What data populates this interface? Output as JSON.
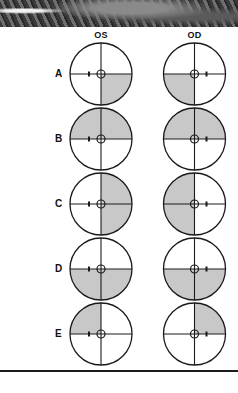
{
  "figure": {
    "photo_strip": "grayscale-fundus-image-fragment",
    "columns": [
      {
        "label": "OS",
        "cx": 101
      },
      {
        "label": "OD",
        "cx": 194.5
      }
    ],
    "radius": 31,
    "fixation_radius": 4,
    "shade_color": "#c8c8c8",
    "line_color": "#1a1a1a",
    "rows": [
      {
        "label": "A",
        "cy": 74,
        "OS": [
          "lower-right"
        ],
        "OD": [
          "lower-left"
        ]
      },
      {
        "label": "B",
        "cy": 139,
        "OS": [
          "upper-left",
          "upper-right"
        ],
        "OD": [
          "upper-left",
          "upper-right"
        ]
      },
      {
        "label": "C",
        "cy": 204,
        "OS": [
          "upper-right",
          "lower-right"
        ],
        "OD": [
          "upper-left",
          "lower-left"
        ]
      },
      {
        "label": "D",
        "cy": 269,
        "OS": [
          "lower-left",
          "lower-right"
        ],
        "OD": [
          "lower-left",
          "lower-right"
        ]
      },
      {
        "label": "E",
        "cy": 334,
        "OS": [
          "upper-left"
        ],
        "OD": [
          "upper-right"
        ]
      }
    ],
    "blind_spot_offset": {
      "OS": -12,
      "OD": 12
    }
  }
}
